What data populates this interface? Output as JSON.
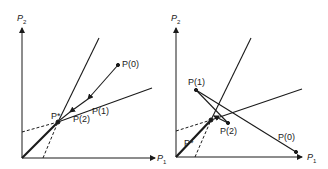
{
  "panels": [
    {
      "id": "left",
      "axes": {
        "x_label": "P",
        "x_sub": "1",
        "y_label": "P",
        "y_sub": "2"
      },
      "points": {
        "p0": "P(0)",
        "p1": "P(1)",
        "p2": "P(2)",
        "pstar": "P*"
      }
    },
    {
      "id": "right",
      "axes": {
        "x_label": "P",
        "x_sub": "1",
        "y_label": "P",
        "y_sub": "2"
      },
      "points": {
        "p0": "P(0)",
        "p1": "P(1)",
        "p2": "P(2)",
        "pstar": "P*"
      }
    }
  ],
  "colors": {
    "line": "#1a1a1a",
    "background": "#ffffff"
  }
}
